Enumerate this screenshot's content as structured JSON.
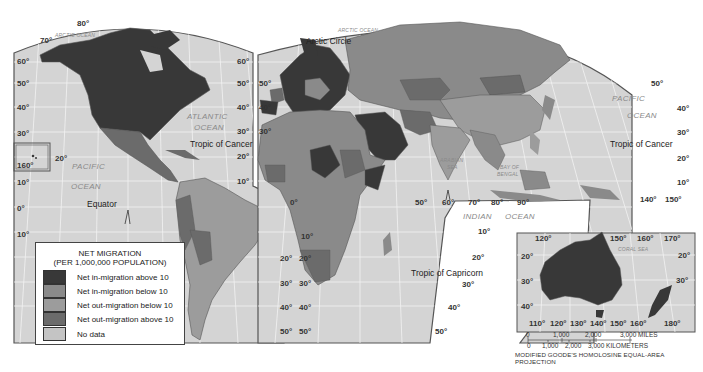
{
  "map": {
    "projection_label": "MODIFIED GOODE'S HOMOLOSINE EQUAL-AREA PROJECTION",
    "colors": {
      "ocean": "#d4d4d4",
      "graticule": "#f2f2f2",
      "border": "#555555",
      "in_above_10": "#383838",
      "in_below_10": "#8a8a8a",
      "out_below_10": "#9c9c9c",
      "out_above_10": "#6b6b6b",
      "no_data": "#c4c4c4"
    },
    "ocean_labels": {
      "arctic_west": "ARCTIC OCEAN",
      "arctic_east": "ARCTIC OCEAN",
      "atlantic_1": "ATLANTIC",
      "atlantic_2": "OCEAN",
      "pacific_w1": "PACIFIC",
      "pacific_w2": "OCEAN",
      "pacific_e1": "PACIFIC",
      "pacific_e2": "OCEAN",
      "indian_1": "INDIAN",
      "indian_2": "OCEAN",
      "arabian_1": "ARABIAN",
      "arabian_2": "SEA",
      "bengal_1": "BAY OF",
      "bengal_2": "BENGAL",
      "coral": "CORAL SEA"
    },
    "line_labels": {
      "arctic_circle": "Arctic Circle",
      "tropic_cancer_west": "Tropic of Cancer",
      "tropic_cancer_east": "Tropic of Cancer",
      "equator": "Equator",
      "tropic_capricorn": "Tropic of Capricorn"
    },
    "degree_labels": {
      "a80": "80°",
      "a70": "70°",
      "wl60": "60°",
      "wl50": "50°",
      "wl40": "40°",
      "wl30": "30°",
      "wl20": "20°",
      "wl10": "10°",
      "wl0": "0°",
      "wl10s": "10°",
      "hawaii160": "160°",
      "hawaii20": "20°",
      "nr60": "60°",
      "nr50": "50°",
      "nr40": "40°",
      "nr30": "30°",
      "nr20": "20°",
      "nr10": "10°",
      "el50": "50°",
      "el40": "40°",
      "el30": "30°",
      "eq0": "0°",
      "sr20": "20°",
      "sr30": "30°",
      "sr40": "40°",
      "sr50": "50°",
      "sl20": "20°",
      "sl30": "30°",
      "sl40": "40°",
      "sl50": "50°",
      "af10": "10°",
      "lon50": "50°",
      "lon60": "60°",
      "lon70": "70°",
      "lon80": "80°",
      "lon90": "90°",
      "in10": "10°",
      "in20": "20°",
      "in30": "30°",
      "in40": "40°",
      "in50": "50°",
      "p50": "50°",
      "p40": "40°",
      "p30": "30°",
      "p20": "20°",
      "p10": "10°",
      "p140": "140°",
      "p150": "150°",
      "au120": "120°",
      "au150": "150°",
      "au160": "160°",
      "au170": "170°",
      "au20l": "20°",
      "au30l": "30°",
      "au40l": "40°",
      "au20r": "20°",
      "au30r": "30°",
      "au110b": "110°",
      "au120b": "120°",
      "au130b": "130°",
      "au140b": "140°",
      "au150b": "150°",
      "au160b": "160°",
      "au180b": "180°"
    }
  },
  "legend": {
    "title": "NET MIGRATION",
    "subtitle": "(PER 1,000,000 POPULATION)",
    "items": [
      {
        "label": "Net in-migration above 10",
        "color": "#383838"
      },
      {
        "label": "Net in-migration below 10",
        "color": "#8a8a8a"
      },
      {
        "label": "Net out-migration below 10",
        "color": "#9c9c9c"
      },
      {
        "label": "Net out-migration above 10",
        "color": "#6b6b6b"
      },
      {
        "label": "No data",
        "color": "#c4c4c4"
      }
    ]
  },
  "scale": {
    "miles": [
      "0",
      "1,000",
      "2,000",
      "3,000 MILES"
    ],
    "kilometers": [
      "0",
      "1,000",
      "2,000",
      "3,000 KILOMETERS"
    ]
  }
}
